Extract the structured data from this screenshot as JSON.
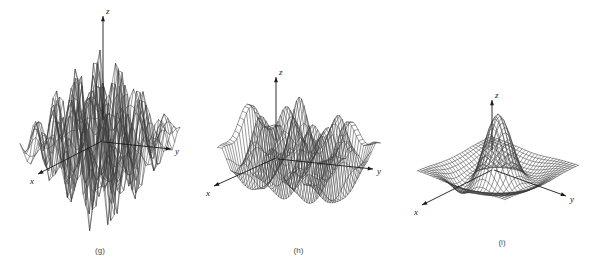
{
  "figure": {
    "background_color": "#ffffff",
    "mesh_color": "#3a3a3a",
    "axis_color": "#1a1a1a",
    "panel_count": 3
  },
  "panels": [
    {
      "id": "g",
      "caption": "(g)",
      "axes": {
        "x": "x",
        "y": "y",
        "z": "z"
      },
      "surface": "tall oscillating wireframe mesh with sharp narrow peaks and valleys"
    },
    {
      "id": "h",
      "caption": "(h)",
      "axes": {
        "x": "x",
        "y": "y",
        "z": "z"
      },
      "surface": "oscillating wireframe ridge mesh with repeated peaks along y"
    },
    {
      "id": "i",
      "caption": "(i)",
      "axes": {
        "x": "x",
        "y": "y",
        "z": "z"
      },
      "surface": "single central gaussian peak with surrounding depression, smooth mesh"
    }
  ],
  "chart_data": [
    {
      "type": "surface",
      "id": "g",
      "title": "(g)",
      "xlabel": "x",
      "ylabel": "y",
      "zlabel": "z",
      "function": "z = sin(pi*x)*sin(pi*y)/(pi*pi*x*y) style multi-peak oscillation",
      "grid": true,
      "grid_n": 26,
      "xlim": [
        -2.6,
        2.6
      ],
      "ylim": [
        -2.6,
        2.6
      ],
      "zlim": [
        -1.0,
        1.0
      ],
      "amplitude": 1.0,
      "freq_x": 1.45,
      "freq_y": 1.45,
      "decay": 0.18,
      "elev_deg": 22,
      "azim_deg": 36,
      "z_scale": 1.45
    },
    {
      "type": "surface",
      "id": "h",
      "title": "(h)",
      "xlabel": "x",
      "ylabel": "y",
      "zlabel": "z",
      "function": "z = cos(pi*y)*exp(-x^2) ridge oscillation along y",
      "grid": true,
      "grid_n": 24,
      "xlim": [
        -2.2,
        2.2
      ],
      "ylim": [
        -2.6,
        2.6
      ],
      "zlim": [
        -1.0,
        1.0
      ],
      "amplitude": 1.0,
      "freq_x": 0.85,
      "freq_y": 1.6,
      "decay": 0.3,
      "elev_deg": 16,
      "azim_deg": 34,
      "z_scale": 1.0
    },
    {
      "type": "surface",
      "id": "i",
      "title": "(i)",
      "xlabel": "x",
      "ylabel": "y",
      "zlabel": "z",
      "function": "z = exp(-(x^2+y^2)) central gaussian peak with annular dip",
      "grid": true,
      "grid_n": 28,
      "xlim": [
        -3.0,
        3.0
      ],
      "ylim": [
        -3.0,
        3.0
      ],
      "zlim": [
        -0.35,
        1.0
      ],
      "amplitude": 1.0,
      "sigma": 0.75,
      "dip_amplitude": 0.3,
      "dip_sigma": 1.5,
      "elev_deg": 26,
      "azim_deg": 40,
      "z_scale": 1.0
    }
  ]
}
